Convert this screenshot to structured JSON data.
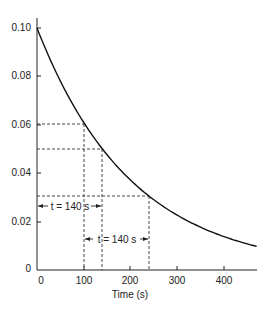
{
  "chart_data": {
    "type": "line",
    "title": "",
    "xlabel": "Time (s)",
    "ylabel": "",
    "xlim": [
      0,
      470
    ],
    "ylim": [
      0,
      0.1
    ],
    "grid": false,
    "x_ticks": [
      "0",
      "100",
      "200",
      "300",
      "400"
    ],
    "y_ticks": [
      "0",
      "0.02",
      "0.04",
      "0.06",
      "0.08",
      "0.10"
    ],
    "series": [
      {
        "name": "decay curve",
        "x": [
          0,
          50,
          100,
          140,
          150,
          200,
          240,
          250,
          300,
          350,
          400,
          450,
          470
        ],
        "y": [
          0.1,
          0.078,
          0.061,
          0.05,
          0.048,
          0.037,
          0.03,
          0.029,
          0.023,
          0.018,
          0.014,
          0.011,
          0.0097
        ]
      }
    ],
    "half_life_s": 140,
    "guides": [
      {
        "label": "0.06 at t=100 s",
        "x": 100,
        "y": 0.06
      },
      {
        "label": "0.05 at t=140 s",
        "x": 140,
        "y": 0.05
      },
      {
        "label": "0.03 at t=240 s",
        "x": 240,
        "y": 0.03
      }
    ],
    "annotations": [
      {
        "text": "t = 140 s",
        "from_x": 0,
        "to_x": 140
      },
      {
        "text": "t = 140 s",
        "from_x": 100,
        "to_x": 240
      }
    ]
  },
  "labels": {
    "x_axis_title": "Time (s)",
    "annotation_1": "t = 140 s",
    "annotation_2": "t = 140 s",
    "xt0": "0",
    "xt1": "100",
    "xt2": "200",
    "xt3": "300",
    "xt4": "400",
    "yt0": "0",
    "yt1": "0.02",
    "yt2": "0.04",
    "yt3": "0.06",
    "yt4": "0.08",
    "yt5": "0.10"
  }
}
